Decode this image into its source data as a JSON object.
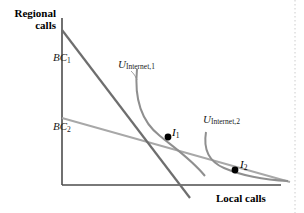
{
  "figure": {
    "type": "economics-indifference-curve-diagram",
    "axes": {
      "y_label": "Regional\ncalls",
      "x_label": "Local calls",
      "origin": [
        62,
        185
      ],
      "x_axis_end": [
        281,
        185
      ],
      "y_axis_top": [
        62,
        18
      ],
      "axis_color": "#4d4d4d"
    },
    "budget_lines": [
      {
        "name": "BC1",
        "label": "BC",
        "subscript": "1",
        "color": "#6e6e6e",
        "from": [
          62,
          30
        ],
        "to": [
          190,
          198
        ],
        "label_pos": [
          53,
          51
        ]
      },
      {
        "name": "BC2",
        "label": "BC",
        "subscript": "2",
        "color": "#a0a0a0",
        "from": [
          62,
          118
        ],
        "to": [
          290,
          182
        ],
        "label_pos": [
          53,
          120
        ]
      }
    ],
    "utility_curves": [
      {
        "name": "U_Internet_1",
        "label": "U",
        "subscript": "Internet,1",
        "color": "#8a8a8a",
        "label_pos": [
          118,
          58
        ],
        "path": "M 137,69 C 134,100 142,122 160,136 C 176,149 192,160 205,176"
      },
      {
        "name": "U_Internet_2",
        "label": "U",
        "subscript": "Internet,2",
        "color": "#8a8a8a",
        "label_pos": [
          203,
          113
        ],
        "path": "M 206,132 C 203,150 210,162 224,168 C 245,177 268,180 288,181"
      }
    ],
    "equilibrium_points": [
      {
        "name": "I1",
        "label": "I",
        "subscript": "1",
        "x": 168,
        "y": 137,
        "label_pos": [
          172,
          126
        ],
        "color": "#000000"
      },
      {
        "name": "I2",
        "label": "I",
        "subscript": "2",
        "x": 235,
        "y": 170,
        "label_pos": [
          240,
          158
        ],
        "color": "#000000"
      }
    ],
    "border": {
      "right_dotted_line_x": 295,
      "color": "#c8c8c8"
    },
    "colors": {
      "background": "#ffffff",
      "text": "#000000",
      "line_dark": "#6e6e6e",
      "line_light": "#a0a0a0"
    }
  }
}
